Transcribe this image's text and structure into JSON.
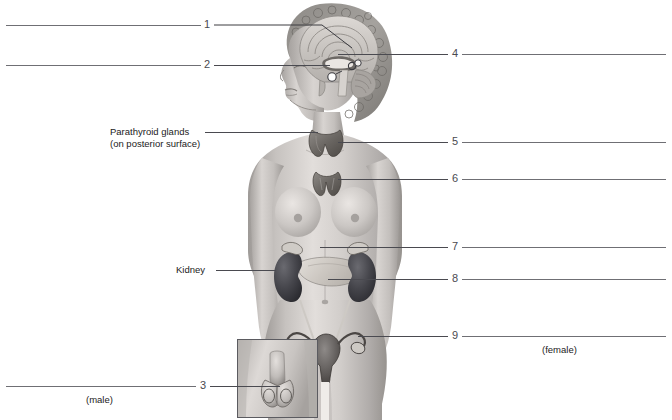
{
  "figure": {
    "skin_tone": "#c9c5c2",
    "organ_dark": "#4b4b50",
    "line_color": "#6f6f74"
  },
  "answer_lines": [
    {
      "id": 1,
      "number": "1",
      "side": "left",
      "pointer": "hypothalamus"
    },
    {
      "id": 2,
      "number": "2",
      "side": "left",
      "pointer": "pituitary-gland"
    },
    {
      "id": 3,
      "number": "3",
      "side": "left",
      "pointer": "testes-inset"
    },
    {
      "id": 4,
      "number": "4",
      "side": "right",
      "pointer": "pineal-gland"
    },
    {
      "id": 5,
      "number": "5",
      "side": "right",
      "pointer": "thyroid-gland"
    },
    {
      "id": 6,
      "number": "6",
      "side": "right",
      "pointer": "thymus"
    },
    {
      "id": 7,
      "number": "7",
      "side": "right",
      "pointer": "adrenal-gland"
    },
    {
      "id": 8,
      "number": "8",
      "side": "right",
      "pointer": "pancreas"
    },
    {
      "id": 9,
      "number": "9",
      "side": "right",
      "pointer": "ovary"
    }
  ],
  "given_labels": [
    {
      "id": "parathyroid",
      "line1": "Parathyroid glands",
      "line2": "(on posterior surface)"
    },
    {
      "id": "kidney",
      "line1": "Kidney",
      "line2": ""
    }
  ],
  "annotations": [
    {
      "id": "male",
      "text": "(male)"
    },
    {
      "id": "female",
      "text": "(female)"
    }
  ]
}
